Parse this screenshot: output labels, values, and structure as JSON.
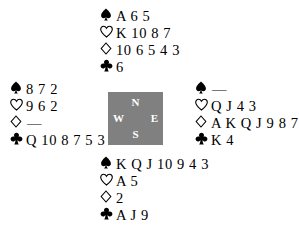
{
  "diagram": {
    "type": "bridge-hand-deal",
    "background_color": "#ffffff",
    "text_color": "#000000"
  },
  "compass": {
    "box_color": "#808080",
    "label_color": "#ffffff",
    "north": "N",
    "west": "W",
    "east": "E",
    "south": "S"
  },
  "suit_symbols": {
    "spade": "spade-suit-icon",
    "heart": "heart-suit-icon",
    "diamond": "diamond-suit-icon",
    "club": "club-suit-icon"
  },
  "hands": {
    "north": {
      "position": "North",
      "spades": "A 6 5",
      "hearts": "K 10 8 7",
      "diamonds": "10 6 5 4 3",
      "clubs": "6"
    },
    "west": {
      "position": "West",
      "spades": "8 7 2",
      "hearts": "9 6 2",
      "diamonds": "—",
      "clubs": "Q 10 8 7 5 3 2"
    },
    "east": {
      "position": "East",
      "spades": "—",
      "hearts": "Q J 4 3",
      "diamonds": "A K Q J 9 8 7",
      "clubs": "K 4"
    },
    "south": {
      "position": "South",
      "spades": "K Q J 10 9 4 3",
      "hearts": "A 5",
      "diamonds": "2",
      "clubs": "A J 9"
    }
  }
}
